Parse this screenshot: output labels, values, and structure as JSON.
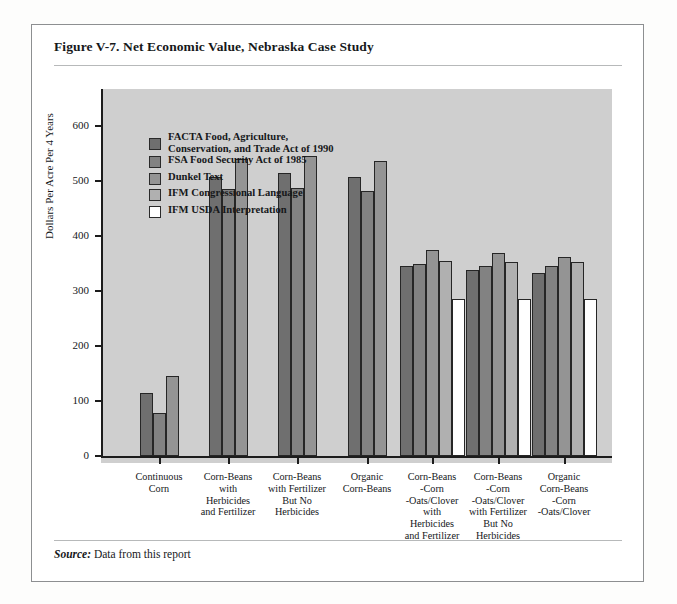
{
  "figure": {
    "title": "Figure V-7.  Net Economic Value, Nebraska Case Study",
    "source_label": "Source:",
    "source_text": " Data from this report"
  },
  "chart_data": {
    "type": "bar",
    "title": "Net Economic Value, Nebraska Case Study",
    "xlabel": "",
    "ylabel": "Dollars Per Acre Per 4 Years",
    "ylim": [
      0,
      650
    ],
    "yticks": [
      0,
      100,
      200,
      300,
      400,
      500,
      600
    ],
    "ytick_labels": [
      "0",
      "100",
      "200",
      "300",
      "400",
      "500",
      "600"
    ],
    "grid": false,
    "legend_position": "upper-left-inside",
    "plot_background": "#cfcfcf",
    "categories": [
      "Continuous\nCorn",
      "Corn-Beans\nwith\nHerbicides\nand Fertilizer",
      "Corn-Beans\nwith Fertilizer\nBut No\nHerbicides",
      "Organic\nCorn-Beans",
      "Corn-Beans\n-Corn\n-Oats/Clover\nwith\nHerbicides\nand Fertilizer",
      "Corn-Beans\n-Corn\n-Oats/Clover\nwith Fertilizer\nBut No\nHerbicides",
      "Organic\nCorn-Beans\n-Corn\n-Oats/Clover"
    ],
    "series": [
      {
        "name": "FACTA  Food, Agriculture, Conservation, and Trade Act of 1990",
        "short": "FACTA",
        "color": "#6f6f6f",
        "values": [
          115,
          508,
          515,
          508,
          345,
          338,
          332
        ]
      },
      {
        "name": "FSA  Food Security Act of 1985",
        "short": "FSA",
        "color": "#828282",
        "values": [
          78,
          485,
          487,
          482,
          350,
          345,
          345
        ]
      },
      {
        "name": "Dunkel Text",
        "short": "Dunkel",
        "color": "#949494",
        "values": [
          145,
          540,
          546,
          536,
          375,
          370,
          362
        ]
      },
      {
        "name": "IFM  Congressional Language",
        "short": "IFM-CL",
        "color": "#b0b0b0",
        "values": [
          null,
          null,
          null,
          null,
          355,
          352,
          352
        ]
      },
      {
        "name": "IFM  USDA Interpretation",
        "short": "IFM-USDA",
        "color": "#ffffff",
        "values": [
          null,
          null,
          null,
          null,
          285,
          285,
          285
        ]
      }
    ]
  },
  "legend": {
    "items": [
      {
        "line1": "FACTA  Food, Agriculture,",
        "line2": "Conservation, and Trade Act of 1990",
        "color": "#6f6f6f"
      },
      {
        "line1": "FSA  Food Security Act of 1985",
        "line2": "",
        "color": "#828282"
      },
      {
        "line1": "Dunkel Text",
        "line2": "",
        "color": "#949494"
      },
      {
        "line1": "IFM  Congressional Language",
        "line2": "",
        "color": "#b0b0b0"
      },
      {
        "line1": "IFM  USDA Interpretation",
        "line2": "",
        "color": "#ffffff"
      }
    ]
  }
}
